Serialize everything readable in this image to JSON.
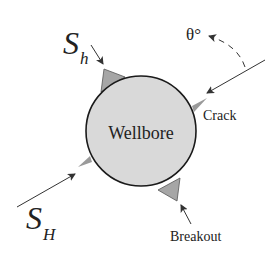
{
  "diagram": {
    "labels": {
      "wellbore": "Wellbore",
      "crack": "Crack",
      "breakout": "Breakout",
      "theta": "θ°",
      "sh_main": "S",
      "sh_sub": "h",
      "sH_main": "S",
      "sH_sub": "H"
    },
    "colors": {
      "wellbore_fill": "#d9d9d9",
      "wellbore_stroke": "#1a1a1a",
      "breakout_fill": "#a6a6a6",
      "crack_fill": "#9a9a9a",
      "arrow": "#333333",
      "text": "#222222"
    },
    "geometry": {
      "wellbore_center": [
        141,
        131
      ],
      "wellbore_radius": 55
    }
  }
}
